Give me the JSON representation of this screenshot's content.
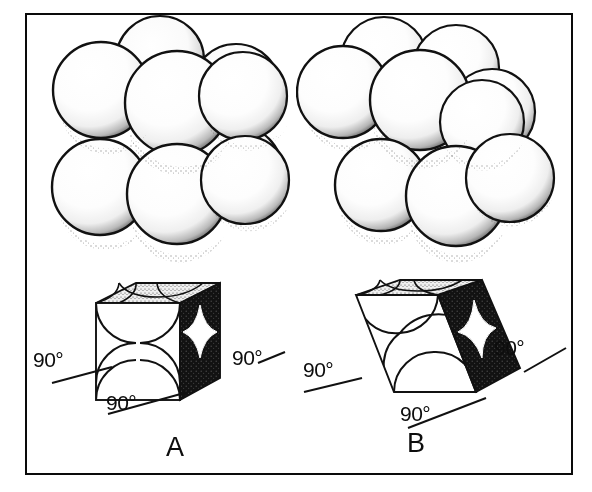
{
  "figure": {
    "background_color": "#ffffff",
    "frame_color": "#0a0a0a",
    "width": 592,
    "height": 492
  },
  "panels": [
    {
      "id": "A",
      "letter": "A",
      "letter_x": 166,
      "letter_y": 432,
      "cluster": {
        "name": "sphere-cluster-cubic",
        "sphere_count": 9,
        "packing": "simple-cubic",
        "sheared": false
      },
      "cell": {
        "name": "unit-cell-cube",
        "shape": "cube",
        "shear_px": 0,
        "front_face_fill": "#ffffff",
        "side_face_fill": "#111111",
        "top_face_fill": "#d8d8d8"
      },
      "angles": [
        {
          "name": "angle-left",
          "text": "90°",
          "x": 33,
          "y": 348
        },
        {
          "name": "angle-bottom",
          "text": "90°",
          "x": 106,
          "y": 391
        },
        {
          "name": "angle-right",
          "text": "90°",
          "x": 232,
          "y": 346
        }
      ]
    },
    {
      "id": "B",
      "letter": "B",
      "letter_x": 407,
      "letter_y": 428,
      "cluster": {
        "name": "sphere-cluster-sheared",
        "sphere_count": 9,
        "packing": "sheared-offset",
        "sheared": true
      },
      "cell": {
        "name": "unit-cell-parallelepiped",
        "shape": "parallelepiped",
        "shear_px": 38,
        "front_face_fill": "#ffffff",
        "side_face_fill": "#111111",
        "top_face_fill": "#d8d8d8"
      },
      "angles": [
        {
          "name": "angle-left",
          "text": "90°",
          "x": 303,
          "y": 358
        },
        {
          "name": "angle-bottom",
          "text": "90°",
          "x": 400,
          "y": 402
        },
        {
          "name": "angle-right",
          "text": "90°",
          "x": 494,
          "y": 336
        }
      ]
    }
  ],
  "icons": {
    "sphere": "sphere-icon",
    "cube": "cube-icon",
    "angle_tick": "angle-tick-icon"
  }
}
